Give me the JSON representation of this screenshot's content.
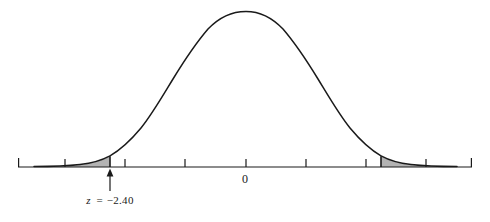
{
  "chart_data": {
    "type": "line",
    "title": "",
    "subtitle": "",
    "xlabel": "",
    "ylabel": "",
    "grid": false,
    "legend": null,
    "distribution": "standard normal",
    "curve": {
      "mean": 0,
      "sd": 1,
      "peak_label": "0"
    },
    "xlim": [
      -4.25,
      3.75
    ],
    "ylim": [
      0,
      1.06
    ],
    "axis_tick_values": [
      -4,
      -3,
      -2,
      -1,
      0,
      1,
      2,
      3
    ],
    "axis_tick_labels": [
      "",
      "",
      "",
      "",
      "0",
      "",
      "",
      ""
    ],
    "annotations": [
      {
        "name": "critical-value-left",
        "z": -2.4,
        "text_var": "z",
        "text_eq": "=",
        "text_value": "−2.40",
        "arrow": "up"
      }
    ],
    "shaded_regions": [
      {
        "name": "left-tail",
        "from": -4.25,
        "to": -2.4,
        "fill": "#b0b0b0"
      },
      {
        "name": "right-tail",
        "from": 2.4,
        "to": 3.75,
        "fill": "#b0b0b0"
      }
    ],
    "tail_area_each": null,
    "x": [
      -4.25,
      -4.0,
      -3.75,
      -3.5,
      -3.25,
      -3.0,
      -2.75,
      -2.5,
      -2.4,
      -2.25,
      -2.0,
      -1.75,
      -1.5,
      -1.25,
      -1.0,
      -0.75,
      -0.5,
      -0.25,
      0,
      0.25,
      0.5,
      0.75,
      1.0,
      1.25,
      1.5,
      1.75,
      2.0,
      2.25,
      2.4,
      2.5,
      2.75,
      3.0,
      3.25,
      3.5,
      3.75
    ],
    "y": [
      0.0004,
      0.0013,
      0.0037,
      0.0091,
      0.02,
      0.0443,
      0.0909,
      0.1753,
      0.2369,
      0.3247,
      0.5461,
      0.7994,
      1.0,
      1.0,
      1.0,
      1.0,
      1.0,
      1.0,
      1.0,
      1.0,
      1.0,
      1.0,
      1.0,
      1.0,
      1.0,
      0.7994,
      0.5461,
      0.3247,
      0.2369,
      0.1753,
      0.0909,
      0.0443,
      0.02,
      0.0091,
      0.0037
    ]
  },
  "labels": {
    "zero": "0",
    "zscore_var": "z",
    "zscore_eq": "=",
    "zscore_value": "−2.40"
  },
  "colors": {
    "curve_stroke": "#1a1a1a",
    "axis_stroke": "#1a1a1a",
    "shade_fill": "#b3b3b3",
    "background": "#ffffff",
    "text": "#1a1a1a"
  }
}
